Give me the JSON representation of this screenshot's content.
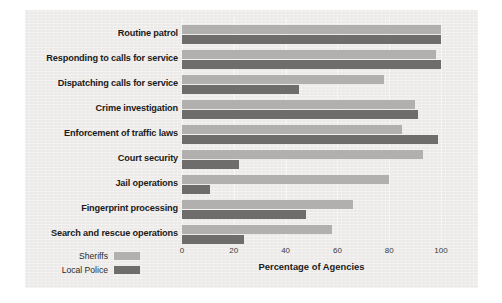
{
  "chart_data": {
    "type": "bar",
    "orientation": "horizontal",
    "title": "",
    "xlabel": "Percentage of Agencies",
    "ylabel": "",
    "xlim": [
      0,
      100
    ],
    "xticks": [
      0,
      20,
      40,
      60,
      80,
      100
    ],
    "grid": true,
    "legend_position": "bottom-left",
    "categories": [
      "Routine patrol",
      "Responding to calls for service",
      "Dispatching calls for service",
      "Crime investigation",
      "Enforcement of traffic laws",
      "Court security",
      "Jail operations",
      "Fingerprint processing",
      "Search and rescue operations"
    ],
    "series": [
      {
        "name": "Sheriffs",
        "color": "#b2b0ae",
        "values": [
          100,
          98,
          78,
          90,
          85,
          93,
          80,
          66,
          58
        ]
      },
      {
        "name": "Local Police",
        "color": "#6f6d6b",
        "values": [
          100,
          100,
          45,
          91,
          99,
          22,
          11,
          48,
          24
        ]
      }
    ]
  },
  "axis": {
    "tick_labels": [
      "0",
      "20",
      "40",
      "60",
      "80",
      "100"
    ],
    "title": "Percentage of Agencies"
  },
  "legend": {
    "entries": [
      {
        "label": "Sheriffs",
        "color": "#b2b0ae"
      },
      {
        "label": "Local Police",
        "color": "#6f6d6b"
      }
    ]
  },
  "colors": {
    "page_background": "#ffffff",
    "panel_background": "#eceae8",
    "gridline": "#f7f6f5",
    "text": "#1b1b1b",
    "sheriffs": "#b2b0ae",
    "local_police": "#6f6d6b"
  }
}
